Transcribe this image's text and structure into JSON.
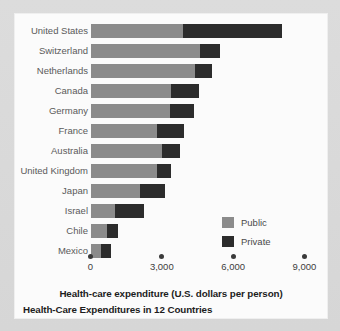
{
  "chart_data": {
    "type": "bar",
    "orientation": "horizontal",
    "stacked": true,
    "title": "Health-Care Expenditures in 12 Countries",
    "xlabel": "Health-care expenditure (U.S. dollars per person)",
    "ylabel": "",
    "xlim": [
      0,
      9000
    ],
    "xticks": [
      0,
      3000,
      6000,
      9000
    ],
    "xtick_labels": [
      "0",
      "3,000",
      "6,000",
      "9,000"
    ],
    "grid": false,
    "legend_position": "center-right",
    "categories": [
      "United States",
      "Switzerland",
      "Netherlands",
      "Canada",
      "Germany",
      "France",
      "Australia",
      "United Kingdom",
      "Japan",
      "Israel",
      "Chile",
      "Mexico"
    ],
    "series": [
      {
        "name": "Public",
        "color": "#8b8b8b",
        "values": [
          3900,
          4600,
          4400,
          3400,
          3350,
          2800,
          3000,
          2800,
          2100,
          1050,
          700,
          450
        ]
      },
      {
        "name": "Private",
        "color": "#2c2c2c",
        "values": [
          4150,
          850,
          700,
          1150,
          1000,
          1150,
          750,
          600,
          1050,
          1200,
          450,
          400
        ]
      }
    ],
    "totals": [
      8050,
      5450,
      5100,
      4550,
      4350,
      3950,
      3750,
      3400,
      3150,
      2250,
      1150,
      850
    ]
  },
  "chart": {
    "title": "Health-Care Expenditures in 12 Countries",
    "xlabel": "Health-care expenditure (U.S. dollars per person)",
    "xtick_labels": [
      "0",
      "3,000",
      "6,000",
      "9,000"
    ],
    "legend": [
      {
        "label": "Public",
        "color": "#8b8b8b"
      },
      {
        "label": "Private",
        "color": "#2c2c2c"
      }
    ],
    "rows": [
      {
        "label": "United States",
        "public": 3900,
        "private": 4150
      },
      {
        "label": "Switzerland",
        "public": 4600,
        "private": 850
      },
      {
        "label": "Netherlands",
        "public": 4400,
        "private": 700
      },
      {
        "label": "Canada",
        "public": 3400,
        "private": 1150
      },
      {
        "label": "Germany",
        "public": 3350,
        "private": 1000
      },
      {
        "label": "France",
        "public": 2800,
        "private": 1150
      },
      {
        "label": "Australia",
        "public": 3000,
        "private": 750
      },
      {
        "label": "United Kingdom",
        "public": 2800,
        "private": 600
      },
      {
        "label": "Japan",
        "public": 2100,
        "private": 1050
      },
      {
        "label": "Israel",
        "public": 1050,
        "private": 1200
      },
      {
        "label": "Chile",
        "public": 700,
        "private": 450
      },
      {
        "label": "Mexico",
        "public": 450,
        "private": 400
      }
    ]
  }
}
